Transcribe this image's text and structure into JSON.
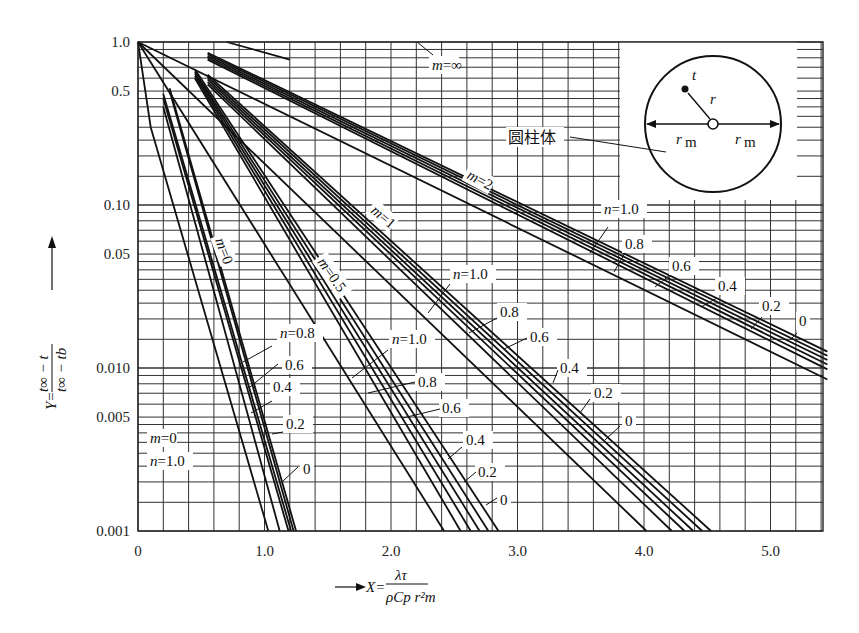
{
  "chart_data": {
    "type": "line",
    "title": "",
    "xlabel": "X = λτ / (ρ C_p r_m²)",
    "ylabel": "Y = (t∞ − t) / (t∞ − t_b)",
    "x_scale": "linear",
    "y_scale": "log",
    "xlim": [
      0,
      5.45
    ],
    "ylim": [
      0.001,
      1.0
    ],
    "grid": true,
    "x_ticks": [
      "0",
      "1.0",
      "2.0",
      "3.0",
      "4.0",
      "5.0"
    ],
    "y_ticks": [
      "1.0",
      "0.5",
      "0.10",
      "0.05",
      "0.010",
      "0.005",
      "0.001"
    ],
    "inset": {
      "label": "圆柱体",
      "point_label": "t",
      "radius_label": "r",
      "half_width_labels": [
        "r_m",
        "r_m"
      ]
    },
    "families": [
      {
        "m_label": "m=0",
        "extra_label": "m=0 / n=1.0",
        "n_labels": [
          "n=0.8",
          "0.6",
          "0.4",
          "0.2",
          "0"
        ],
        "series": [
          {
            "n": 1.0,
            "x": [
              0,
              0.1,
              1.03
            ],
            "y": [
              1.0,
              0.3,
              0.001
            ]
          },
          {
            "n": 0.8,
            "x": [
              0.2,
              1.12
            ],
            "y": [
              0.4,
              0.001
            ]
          },
          {
            "n": 0.6,
            "x": [
              0.2,
              1.19
            ],
            "y": [
              0.45,
              0.001
            ]
          },
          {
            "n": 0.4,
            "x": [
              0.2,
              1.21
            ],
            "y": [
              0.48,
              0.001
            ]
          },
          {
            "n": 0.2,
            "x": [
              0.25,
              1.23
            ],
            "y": [
              0.5,
              0.001
            ]
          },
          {
            "n": 0.0,
            "x": [
              0.25,
              1.25
            ],
            "y": [
              0.52,
              0.001
            ]
          }
        ]
      },
      {
        "m_label": "m=0.5",
        "n_labels": [
          "n=1.0",
          "0.8",
          "0.6",
          "0.4",
          "0.2",
          "0"
        ],
        "series": [
          {
            "n": 1.0,
            "x": [
              0,
              2.42
            ],
            "y": [
              1.0,
              0.001
            ]
          },
          {
            "n": 0.8,
            "x": [
              0.45,
              2.55
            ],
            "y": [
              0.6,
              0.001
            ]
          },
          {
            "n": 0.6,
            "x": [
              0.45,
              2.63
            ],
            "y": [
              0.62,
              0.001
            ]
          },
          {
            "n": 0.4,
            "x": [
              0.45,
              2.7
            ],
            "y": [
              0.64,
              0.001
            ]
          },
          {
            "n": 0.2,
            "x": [
              0.45,
              2.77
            ],
            "y": [
              0.66,
              0.001
            ]
          },
          {
            "n": 0.0,
            "x": [
              0.45,
              2.85
            ],
            "y": [
              0.68,
              0.001
            ]
          }
        ]
      },
      {
        "m_label": "m=1",
        "n_labels": [
          "n=1.0",
          "0.8",
          "0.6",
          "0.4",
          "0.2",
          "0"
        ],
        "series": [
          {
            "n": 1.0,
            "x": [
              0,
              4.02
            ],
            "y": [
              1.0,
              0.001
            ]
          },
          {
            "n": 0.8,
            "x": [
              0.55,
              4.22
            ],
            "y": [
              0.55,
              0.001
            ]
          },
          {
            "n": 0.6,
            "x": [
              0.55,
              4.32
            ],
            "y": [
              0.57,
              0.001
            ]
          },
          {
            "n": 0.4,
            "x": [
              0.55,
              4.39
            ],
            "y": [
              0.59,
              0.001
            ]
          },
          {
            "n": 0.2,
            "x": [
              0.55,
              4.46
            ],
            "y": [
              0.61,
              0.001
            ]
          },
          {
            "n": 0.0,
            "x": [
              0.55,
              4.53
            ],
            "y": [
              0.63,
              0.001
            ]
          }
        ]
      },
      {
        "m_label": "m=2",
        "n_labels": [
          "n=1.0",
          "0.8",
          "0.6",
          "0.4",
          "0.2",
          "0"
        ],
        "series": [
          {
            "n": 1.0,
            "x": [
              0,
              5.45
            ],
            "y": [
              1.0,
              0.0085
            ]
          },
          {
            "n": 0.8,
            "x": [
              0.55,
              5.45
            ],
            "y": [
              0.78,
              0.0098
            ]
          },
          {
            "n": 0.6,
            "x": [
              0.55,
              5.45
            ],
            "y": [
              0.8,
              0.0105
            ]
          },
          {
            "n": 0.4,
            "x": [
              0.55,
              5.45
            ],
            "y": [
              0.82,
              0.0112
            ]
          },
          {
            "n": 0.2,
            "x": [
              0.55,
              5.45
            ],
            "y": [
              0.84,
              0.0119
            ]
          },
          {
            "n": 0.0,
            "x": [
              0.55,
              5.45
            ],
            "y": [
              0.86,
              0.0126
            ]
          }
        ]
      },
      {
        "m_label": "m=∞",
        "n_labels": [],
        "series": [
          {
            "n": null,
            "x": [
              0.7,
              1.2
            ],
            "y": [
              1.0,
              0.78
            ]
          }
        ]
      }
    ]
  },
  "labels": {
    "y_prefix": "Y=",
    "y_num": "t∞ − t",
    "y_den": "t∞ − tb",
    "x_prefix": "X=",
    "x_num": "λτ",
    "x_den": "ρCp r²m",
    "cylinder": "圆柱体"
  }
}
